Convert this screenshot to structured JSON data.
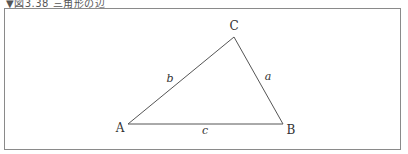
{
  "caption": "▼図3.38 三角形の辺",
  "diagram": {
    "type": "triangle",
    "vertices": [
      {
        "name": "A",
        "x": 128,
        "y": 124,
        "label_x": 120,
        "label_y": 132
      },
      {
        "name": "B",
        "x": 283,
        "y": 124,
        "label_x": 291,
        "label_y": 134
      },
      {
        "name": "C",
        "x": 234,
        "y": 37,
        "label_x": 234,
        "label_y": 30
      }
    ],
    "sides": [
      {
        "name": "a",
        "between": [
          "B",
          "C"
        ],
        "label_x": 268,
        "label_y": 80
      },
      {
        "name": "b",
        "between": [
          "A",
          "C"
        ],
        "label_x": 170,
        "label_y": 82
      },
      {
        "name": "c",
        "between": [
          "A",
          "B"
        ],
        "label_x": 205,
        "label_y": 134
      }
    ],
    "line_color": "#555555"
  }
}
